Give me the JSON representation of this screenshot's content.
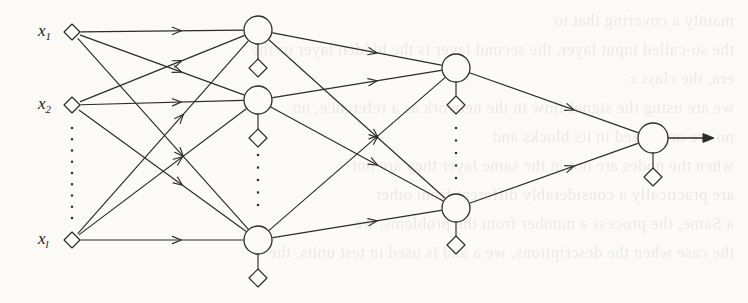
{
  "figure": {
    "background_color": "#fbfaf7",
    "ink_color": "#2b2b2b",
    "width": 748,
    "height": 303
  },
  "input_layer": {
    "name": "input-layer",
    "node_shape": "diamond",
    "nodes": [
      {
        "id": "x1",
        "label": "x",
        "subscript": "1",
        "cx": 72,
        "cy": 32
      },
      {
        "id": "x2",
        "label": "x",
        "subscript": "2",
        "cx": 72,
        "cy": 105
      },
      {
        "id": "xl",
        "label": "x",
        "subscript": "l",
        "cx": 72,
        "cy": 240
      }
    ],
    "ellipsis": {
      "x": 72,
      "y_start": 128,
      "y_end": 218,
      "dots": 9
    }
  },
  "hidden_layer_1": {
    "name": "first-hidden-layer",
    "node_shape": "circle",
    "radius": 14,
    "nodes": [
      {
        "id": "h1-1",
        "cx": 258,
        "cy": 30,
        "bias_cy": 68
      },
      {
        "id": "h1-2",
        "cx": 258,
        "cy": 100,
        "bias_cy": 138
      },
      {
        "id": "h1-3",
        "cx": 258,
        "cy": 240,
        "bias_cy": 278
      }
    ],
    "ellipsis": {
      "x": 258,
      "y_start": 155,
      "y_end": 205,
      "dots": 5
    }
  },
  "hidden_layer_2": {
    "name": "second-hidden-layer",
    "node_shape": "circle",
    "radius": 14,
    "nodes": [
      {
        "id": "h2-1",
        "cx": 456,
        "cy": 68,
        "bias_cy": 105
      },
      {
        "id": "h2-2",
        "cx": 456,
        "cy": 208,
        "bias_cy": 245
      }
    ],
    "ellipsis": {
      "x": 456,
      "y_start": 128,
      "y_end": 178,
      "dots": 5
    }
  },
  "output_layer": {
    "name": "output-layer",
    "node_shape": "circle",
    "radius": 15,
    "nodes": [
      {
        "id": "out-1",
        "cx": 653,
        "cy": 138,
        "bias_cy": 177
      }
    ],
    "output_arrow": {
      "x1": 668,
      "y1": 138,
      "x2": 714,
      "y2": 138
    }
  },
  "edges": {
    "input_to_hidden1": [
      {
        "from": "x1",
        "to": "h1-1"
      },
      {
        "from": "x1",
        "to": "h1-2"
      },
      {
        "from": "x1",
        "to": "h1-3"
      },
      {
        "from": "x2",
        "to": "h1-1"
      },
      {
        "from": "x2",
        "to": "h1-2"
      },
      {
        "from": "x2",
        "to": "h1-3"
      },
      {
        "from": "xl",
        "to": "h1-1"
      },
      {
        "from": "xl",
        "to": "h1-2"
      },
      {
        "from": "xl",
        "to": "h1-3"
      }
    ],
    "hidden1_to_hidden2": [
      {
        "from": "h1-1",
        "to": "h2-1"
      },
      {
        "from": "h1-1",
        "to": "h2-2"
      },
      {
        "from": "h1-2",
        "to": "h2-1"
      },
      {
        "from": "h1-2",
        "to": "h2-2"
      },
      {
        "from": "h1-3",
        "to": "h2-1"
      },
      {
        "from": "h1-3",
        "to": "h2-2"
      }
    ],
    "hidden2_to_output": [
      {
        "from": "h2-1",
        "to": "out-1"
      },
      {
        "from": "h2-2",
        "to": "out-1"
      }
    ]
  },
  "bias_marker": {
    "name": "bias-diamond",
    "shape": "diamond",
    "size": 9,
    "stem": true
  },
  "bleed_through_text": [
    "mainly a covering that to",
    "the so-called input layer, the second layer is the hidden layer or the",
    "era, the class c",
    "we are using the signal flow in the network as a reference, no",
    "no are organized in its blocks and",
    "when the nodes are not in the same layer they are not",
    "are practically a considerably different from other",
    "a Same, the process a number from the problems, we",
    "the case when the descriptions, we a and is used in test units, the"
  ]
}
